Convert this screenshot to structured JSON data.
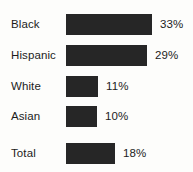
{
  "chart_data": {
    "type": "bar",
    "orientation": "horizontal",
    "title": "",
    "subtitle": "",
    "xlabel": "",
    "ylabel": "",
    "grid": false,
    "legend": null,
    "axis_visible": false,
    "tick_labels": [],
    "categories": [
      "Black",
      "Hispanic",
      "White",
      "Asian",
      "Total"
    ],
    "values": [
      33,
      29,
      11,
      10,
      18
    ],
    "value_labels": [
      "33%",
      "29%",
      "11%",
      "10%",
      "18%"
    ],
    "value_unit": "%",
    "xlim": [
      0,
      40
    ],
    "series": [
      {
        "name": "",
        "values": [
          33,
          29,
          11,
          10,
          18
        ]
      }
    ],
    "bars": [
      {
        "category": "Black",
        "value": 33,
        "value_label": "33%",
        "bar_px": 86,
        "row_top_px": 13
      },
      {
        "category": "Hispanic",
        "value": 29,
        "value_label": "29%",
        "bar_px": 81,
        "row_top_px": 44
      },
      {
        "category": "White",
        "value": 11,
        "value_label": "11%",
        "bar_px": 32,
        "row_top_px": 75
      },
      {
        "category": "Asian",
        "value": 10,
        "value_label": "10%",
        "bar_px": 31,
        "row_top_px": 105
      },
      {
        "category": "Total",
        "value": 18,
        "value_label": "18%",
        "bar_px": 49,
        "row_top_px": 142
      }
    ],
    "colors": {
      "bar_fill": "#262626",
      "background": "#fdfdfb",
      "label_text": "#1c1c1c",
      "value_text": "#1c1c1c"
    }
  }
}
